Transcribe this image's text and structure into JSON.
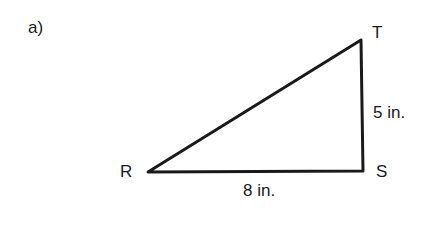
{
  "problem_label": "a)",
  "triangle": {
    "vertices": [
      {
        "name": "R",
        "x": 148,
        "y": 172
      },
      {
        "name": "S",
        "x": 363,
        "y": 171
      },
      {
        "name": "T",
        "x": 361,
        "y": 40
      }
    ],
    "sides": [
      {
        "from": "R",
        "to": "S",
        "label": "8 in."
      },
      {
        "from": "S",
        "to": "T",
        "label": "5 in."
      },
      {
        "from": "R",
        "to": "T",
        "label": ""
      }
    ],
    "stroke_color": "#1a1a1a"
  }
}
